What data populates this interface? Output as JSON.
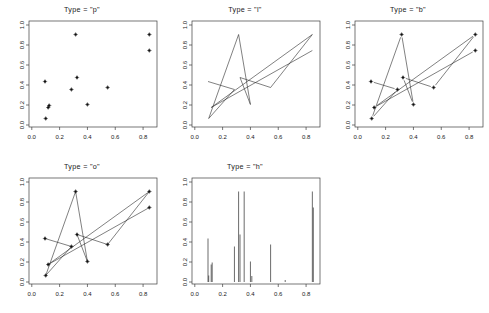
{
  "figure": {
    "background_color": "#ffffff",
    "foreground_color": "#1a1a1a",
    "width": 489,
    "height": 313,
    "panel_count": 5
  },
  "axes": {
    "x_ticks": [
      "0.0",
      "0.2",
      "0.4",
      "0.6",
      "0.8"
    ],
    "x_tick_values": [
      0.0,
      0.2,
      0.4,
      0.6,
      0.8
    ],
    "y_ticks": [
      "0.0",
      "0.2",
      "0.4",
      "0.6",
      "0.8",
      "1.0"
    ],
    "y_tick_values": [
      0.0,
      0.2,
      0.4,
      0.6,
      0.8,
      1.0
    ],
    "xlim": [
      -0.02,
      0.9
    ],
    "ylim": [
      -0.02,
      1.04
    ],
    "grid": false
  },
  "chart_data": [
    {
      "type": "scatter",
      "title": "Type = \"p\"",
      "plot_type_code": "p",
      "xlabel": "",
      "ylabel": "",
      "xlim": [
        -0.02,
        0.9
      ],
      "ylim": [
        -0.02,
        1.04
      ],
      "x_ticks": [
        0.0,
        0.2,
        0.4,
        0.6,
        0.8
      ],
      "y_ticks": [
        0.0,
        0.2,
        0.4,
        0.6,
        0.8,
        1.0
      ],
      "x": [
        0.095,
        0.285,
        0.1,
        0.315,
        0.4,
        0.305,
        0.325,
        0.845,
        0.545,
        0.845,
        0.118,
        0.125,
        0.845
      ],
      "y": [
        0.435,
        0.355,
        0.065,
        0.905,
        0.205,
        0.905,
        0.475,
        0.905,
        0.375,
        0.745,
        0.175,
        0.195,
        0.745
      ],
      "points": [
        {
          "x": 0.095,
          "y": 0.435
        },
        {
          "x": 0.285,
          "y": 0.355
        },
        {
          "x": 0.1,
          "y": 0.065
        },
        {
          "x": 0.315,
          "y": 0.905
        },
        {
          "x": 0.4,
          "y": 0.205
        },
        {
          "x": 0.325,
          "y": 0.475
        },
        {
          "x": 0.545,
          "y": 0.375
        },
        {
          "x": 0.845,
          "y": 0.905
        },
        {
          "x": 0.845,
          "y": 0.745
        },
        {
          "x": 0.118,
          "y": 0.175
        },
        {
          "x": 0.125,
          "y": 0.195
        }
      ],
      "grid": false,
      "legend": null
    },
    {
      "type": "line",
      "title": "Type = \"l\"",
      "plot_type_code": "l",
      "xlabel": "",
      "ylabel": "",
      "xlim": [
        -0.02,
        0.9
      ],
      "ylim": [
        -0.02,
        1.04
      ],
      "x_ticks": [
        0.0,
        0.2,
        0.4,
        0.6,
        0.8
      ],
      "y_ticks": [
        0.0,
        0.2,
        0.4,
        0.6,
        0.8,
        1.0
      ],
      "series": [
        {
          "name": "data",
          "x": [
            0.095,
            0.285,
            0.1,
            0.315,
            0.4,
            0.325,
            0.545,
            0.845,
            0.118,
            0.845
          ],
          "y": [
            0.435,
            0.355,
            0.065,
            0.905,
            0.205,
            0.475,
            0.375,
            0.905,
            0.175,
            0.745
          ]
        }
      ],
      "grid": false,
      "legend": null
    },
    {
      "type": "line",
      "title": "Type = \"b\"",
      "plot_type_code": "b",
      "xlabel": "",
      "ylabel": "",
      "xlim": [
        -0.02,
        0.9
      ],
      "ylim": [
        -0.02,
        1.04
      ],
      "x_ticks": [
        0.0,
        0.2,
        0.4,
        0.6,
        0.8
      ],
      "y_ticks": [
        0.0,
        0.2,
        0.4,
        0.6,
        0.8,
        1.0
      ],
      "markers": true,
      "line_gaps": true,
      "series": [
        {
          "name": "data",
          "x": [
            0.095,
            0.285,
            0.1,
            0.315,
            0.4,
            0.325,
            0.545,
            0.845,
            0.118,
            0.845
          ],
          "y": [
            0.435,
            0.355,
            0.065,
            0.905,
            0.205,
            0.475,
            0.375,
            0.905,
            0.175,
            0.745
          ]
        }
      ],
      "grid": false,
      "legend": null
    },
    {
      "type": "line",
      "title": "Type = \"o\"",
      "plot_type_code": "o",
      "xlabel": "",
      "ylabel": "",
      "xlim": [
        -0.02,
        0.9
      ],
      "ylim": [
        -0.02,
        1.04
      ],
      "x_ticks": [
        0.0,
        0.2,
        0.4,
        0.6,
        0.8
      ],
      "y_ticks": [
        0.0,
        0.2,
        0.4,
        0.6,
        0.8,
        1.0
      ],
      "markers": true,
      "line_gaps": false,
      "series": [
        {
          "name": "data",
          "x": [
            0.095,
            0.285,
            0.1,
            0.315,
            0.4,
            0.325,
            0.545,
            0.845,
            0.118,
            0.845
          ],
          "y": [
            0.435,
            0.355,
            0.065,
            0.905,
            0.205,
            0.475,
            0.375,
            0.905,
            0.175,
            0.745
          ]
        }
      ],
      "grid": false,
      "legend": null
    },
    {
      "type": "bar",
      "title": "Type = \"h\"",
      "plot_type_code": "h",
      "xlabel": "",
      "ylabel": "",
      "xlim": [
        -0.02,
        0.9
      ],
      "ylim": [
        -0.02,
        1.04
      ],
      "x_ticks": [
        0.0,
        0.2,
        0.4,
        0.6,
        0.8
      ],
      "y_ticks": [
        0.0,
        0.2,
        0.4,
        0.6,
        0.8,
        1.0
      ],
      "bars": [
        {
          "x": 0.095,
          "height": 0.435
        },
        {
          "x": 0.118,
          "height": 0.175
        },
        {
          "x": 0.125,
          "height": 0.195
        },
        {
          "x": 0.1,
          "height": 0.065
        },
        {
          "x": 0.285,
          "height": 0.355
        },
        {
          "x": 0.315,
          "height": 0.905
        },
        {
          "x": 0.325,
          "height": 0.475
        },
        {
          "x": 0.355,
          "height": 0.905
        },
        {
          "x": 0.4,
          "height": 0.205
        },
        {
          "x": 0.41,
          "height": 0.06
        },
        {
          "x": 0.545,
          "height": 0.375
        },
        {
          "x": 0.65,
          "height": 0.02
        },
        {
          "x": 0.845,
          "height": 0.905
        },
        {
          "x": 0.852,
          "height": 0.745
        }
      ],
      "grid": false,
      "legend": null
    }
  ]
}
